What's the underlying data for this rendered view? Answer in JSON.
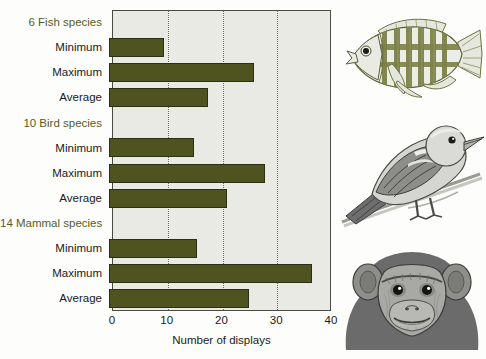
{
  "chart_data": {
    "type": "bar",
    "orientation": "horizontal",
    "title": "",
    "xlabel": "Number of displays",
    "ylabel": "",
    "xlim": [
      0,
      40
    ],
    "xticks": [
      0,
      10,
      20,
      30,
      40
    ],
    "xtick_labels": [
      "0",
      "10",
      "20",
      "30",
      "40"
    ],
    "grid": "vertical dotted gridlines at 10, 20, 30",
    "legend": "none",
    "bar_color": "#4f5320",
    "plot_background": "#e9eae3",
    "group_label_color": "#565c1f",
    "rows": [
      {
        "label": "6 Fish species",
        "kind": "group",
        "value": null
      },
      {
        "label": "Minimum",
        "kind": "bar",
        "value": 10
      },
      {
        "label": "Maximum",
        "kind": "bar",
        "value": 26.5
      },
      {
        "label": "Average",
        "kind": "bar",
        "value": 18
      },
      {
        "label": "10 Bird species",
        "kind": "group",
        "value": null
      },
      {
        "label": "Minimum",
        "kind": "bar",
        "value": 15.5
      },
      {
        "label": "Maximum",
        "kind": "bar",
        "value": 28.5
      },
      {
        "label": "Average",
        "kind": "bar",
        "value": 21.5
      },
      {
        "label": "14 Mammal species",
        "kind": "group",
        "value": null
      },
      {
        "label": "Minimum",
        "kind": "bar",
        "value": 16
      },
      {
        "label": "Maximum",
        "kind": "bar",
        "value": 37
      },
      {
        "label": "Average",
        "kind": "bar",
        "value": 25.5
      }
    ],
    "groups": [
      {
        "name": "6 Fish species",
        "count": 6,
        "taxon": "Fish",
        "minimum": 10,
        "maximum": 26.5,
        "average": 18
      },
      {
        "name": "10 Bird species",
        "count": 10,
        "taxon": "Bird",
        "minimum": 15.5,
        "maximum": 28.5,
        "average": 21.5
      },
      {
        "name": "14 Mammal species",
        "count": 14,
        "taxon": "Mammal",
        "minimum": 16,
        "maximum": 37,
        "average": 25.5
      }
    ]
  },
  "illustrations": [
    {
      "name": "fish-illustration",
      "subject": "cichlid fish",
      "style": "olive-green line drawing"
    },
    {
      "name": "bird-illustration",
      "subject": "finch on branch",
      "style": "grayscale line drawing"
    },
    {
      "name": "mammal-illustration",
      "subject": "chimpanzee head",
      "style": "grayscale line drawing"
    }
  ]
}
